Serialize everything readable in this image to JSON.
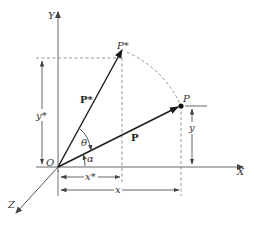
{
  "diagram": {
    "type": "vector-rotation-diagram",
    "axes": {
      "x_label": "X",
      "y_label": "Y",
      "z_label": "Z",
      "origin_label": "O"
    },
    "points": {
      "p_label": "P",
      "p_star_label": "P*"
    },
    "vectors": {
      "p_label": "P",
      "p_star_label": "P*"
    },
    "angles": {
      "theta": "θ",
      "alpha": "α"
    },
    "dimensions": {
      "x": "x",
      "x_star": "x*",
      "y": "y",
      "y_star": "y*"
    },
    "colors": {
      "axis": "#555555",
      "vector": "#222222",
      "dashed": "#777777"
    }
  }
}
